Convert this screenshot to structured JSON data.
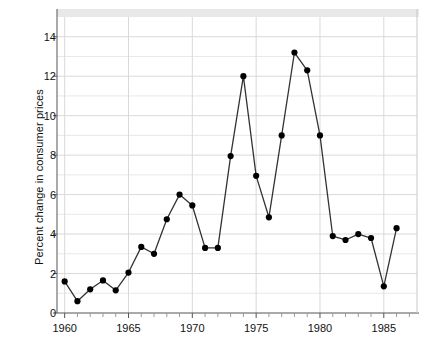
{
  "chart_data": {
    "type": "line",
    "title": "",
    "subtitle": "",
    "xlabel": "",
    "ylabel": "Percent change in consumer prices",
    "xlim": [
      1959.4,
      1987.6
    ],
    "ylim": [
      0,
      15.0
    ],
    "xticks": [
      1960,
      1965,
      1970,
      1975,
      1980,
      1985
    ],
    "xtick_labels": [
      "1960",
      "1965",
      "1970",
      "1975",
      "1980",
      "1985"
    ],
    "yticks": [
      0,
      2,
      4,
      6,
      8,
      10,
      12,
      14
    ],
    "ytick_labels": [
      "0",
      "2",
      "4",
      "6",
      "8",
      "10",
      "12",
      "14"
    ],
    "minor_yticks": [
      1,
      3,
      5,
      7,
      9,
      11,
      13
    ],
    "minor_xtick_interval": 1,
    "grid": true,
    "grid_color": "#e8e8e8",
    "legend": null,
    "legend_position": "none",
    "marker": "circle",
    "marker_color": "#000000",
    "line_color": "#333333",
    "x": [
      1960,
      1961,
      1962,
      1963,
      1964,
      1965,
      1966,
      1967,
      1968,
      1969,
      1970,
      1971,
      1972,
      1973,
      1974,
      1975,
      1976,
      1977,
      1978,
      1979,
      1980,
      1981,
      1982,
      1983,
      1984,
      1985,
      1986,
      1987
    ],
    "values": [
      1.6,
      0.6,
      1.2,
      1.65,
      1.15,
      2.05,
      3.35,
      3.0,
      4.75,
      6.0,
      5.45,
      3.3,
      3.3,
      7.95,
      12.0,
      6.95,
      4.85,
      9.0,
      13.2,
      12.3,
      9.0,
      3.9,
      3.7,
      4.0,
      3.8,
      1.35,
      4.3,
      4.3
    ],
    "series": [
      {
        "name": "Percent change in consumer prices",
        "values": [
          1.6,
          0.6,
          1.2,
          1.65,
          1.15,
          2.05,
          3.35,
          3.0,
          4.75,
          6.0,
          5.45,
          3.3,
          3.3,
          7.95,
          12.0,
          6.95,
          4.85,
          9.0,
          13.2,
          12.3,
          9.0,
          3.9,
          3.7,
          4.0,
          3.8,
          1.35,
          4.3,
          4.3
        ]
      }
    ],
    "points": [
      {
        "x": 1960,
        "y": 1.6
      },
      {
        "x": 1961,
        "y": 0.6
      },
      {
        "x": 1962,
        "y": 1.2
      },
      {
        "x": 1963,
        "y": 1.65
      },
      {
        "x": 1964,
        "y": 1.15
      },
      {
        "x": 1965,
        "y": 2.05
      },
      {
        "x": 1966,
        "y": 3.35
      },
      {
        "x": 1967,
        "y": 3.0
      },
      {
        "x": 1968,
        "y": 4.75
      },
      {
        "x": 1969,
        "y": 6.0
      },
      {
        "x": 1970,
        "y": 5.45
      },
      {
        "x": 1971,
        "y": 3.3
      },
      {
        "x": 1972,
        "y": 3.3
      },
      {
        "x": 1973,
        "y": 7.95
      },
      {
        "x": 1974,
        "y": 12.0
      },
      {
        "x": 1975,
        "y": 6.95
      },
      {
        "x": 1976,
        "y": 4.85
      },
      {
        "x": 1977,
        "y": 9.0
      },
      {
        "x": 1978,
        "y": 13.2
      },
      {
        "x": 1979,
        "y": 12.3
      },
      {
        "x": 1980,
        "y": 9.0
      },
      {
        "x": 1981,
        "y": 3.9
      },
      {
        "x": 1982,
        "y": 3.7
      },
      {
        "x": 1983,
        "y": 4.0
      },
      {
        "x": 1984,
        "y": 3.8
      },
      {
        "x": 1985,
        "y": 1.35
      },
      {
        "x": 1986,
        "y": 4.3
      }
    ],
    "colors": {
      "line": "#333333",
      "marker": "#000000",
      "grid": "#e8e8e8",
      "axis": "#808080",
      "text": "#111111",
      "top_band": "#e0e0e0",
      "background": "#ffffff"
    }
  },
  "plot": {
    "left": 57,
    "right": 417,
    "top": 17,
    "bottom": 313
  }
}
